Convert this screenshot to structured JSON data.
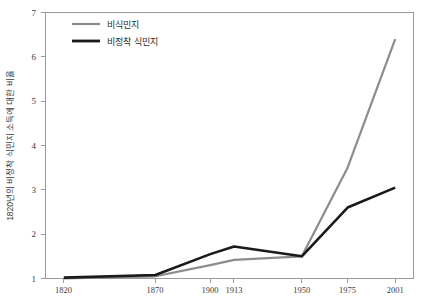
{
  "chart_data": {
    "type": "line",
    "title": "",
    "xlabel": "",
    "ylabel": "1820년의 비정착 식민지 소득에 대한 비율",
    "categories": [
      "1820",
      "1870",
      "1900",
      "1913",
      "1950",
      "1975",
      "2001"
    ],
    "x": [
      1820,
      1870,
      1900,
      1913,
      1950,
      1975,
      2001
    ],
    "xlim": [
      1810,
      2011
    ],
    "ylim": [
      1,
      7
    ],
    "yticks": [
      1,
      2,
      3,
      4,
      5,
      6,
      7
    ],
    "ytick_labels": [
      "1",
      "2",
      "3",
      "4",
      "5",
      "6",
      "7"
    ],
    "grid": false,
    "legend_position": "top-left",
    "series": [
      {
        "name": "비식민지",
        "color": "#8c8c8c",
        "width": 2.2,
        "values": [
          1.0,
          1.05,
          1.3,
          1.42,
          1.5,
          3.5,
          6.4
        ]
      },
      {
        "name": "비정착 식민지",
        "color": "#1a1a1a",
        "width": 2.6,
        "values": [
          1.02,
          1.08,
          1.55,
          1.72,
          1.5,
          2.6,
          3.05
        ]
      }
    ]
  },
  "legend": {
    "items": [
      {
        "label": "비식민지",
        "color": "#8c8c8c"
      },
      {
        "label": "비정착 식민지",
        "color": "#1a1a1a"
      }
    ]
  },
  "axes": {
    "y_title": "1820년의 비정착 식민지 소득에 대한 비율",
    "y_tick_labels": [
      "7",
      "6",
      "5",
      "4",
      "3",
      "2",
      "1"
    ],
    "x_tick_labels": [
      "1820",
      "1870",
      "1900",
      "1913",
      "1950",
      "1975",
      "2001"
    ]
  }
}
